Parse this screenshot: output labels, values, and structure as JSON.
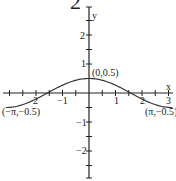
{
  "figure_number_partial": "2",
  "chart_data": {
    "type": "line",
    "title": "",
    "function": "y = 0.5 cos x",
    "xlabel": "x",
    "ylabel": "y",
    "xlim": [
      -3.3,
      3.3
    ],
    "ylim": [
      -2.9,
      2.9
    ],
    "x_tick_labels": [
      "-2",
      "-1",
      "1",
      "2",
      "3"
    ],
    "y_tick_labels": [
      "2",
      "1",
      "-1",
      "-2"
    ],
    "x_tick_step": 0.5,
    "y_tick_step": 0.5,
    "grid": false,
    "series": [
      {
        "name": "0.5 cos x",
        "x": [
          -3.1416,
          -2.5,
          -2.0,
          -1.5708,
          -1.0,
          -0.5,
          0,
          0.5,
          1.0,
          1.5708,
          2.0,
          2.5,
          3.1416
        ],
        "values": [
          -0.5,
          -0.4,
          -0.208,
          0,
          0.27,
          0.439,
          0.5,
          0.439,
          0.27,
          0,
          -0.208,
          -0.4,
          -0.5
        ]
      }
    ],
    "annotations": [
      {
        "text": "(0,0.5)",
        "x": 0,
        "y": 0.5
      },
      {
        "text": "(−π,−0.5)",
        "x": -3.1416,
        "y": -0.5
      },
      {
        "text": "(π,−0.5)",
        "x": 3.1416,
        "y": -0.5
      }
    ],
    "color": "#333333"
  },
  "labels": {
    "x_axis": "x",
    "y_axis": "y",
    "xt": {
      "m2": "2",
      "m1": "−1",
      "p1": "1",
      "p2": "2",
      "p3": "3"
    },
    "yt": {
      "p2": "2",
      "p1": "1",
      "m1": "−1",
      "m2": "−2"
    },
    "ann_max": "(0,0.5)",
    "ann_left": "(−π,−0.5)",
    "ann_right": "(π,−0.5)"
  }
}
